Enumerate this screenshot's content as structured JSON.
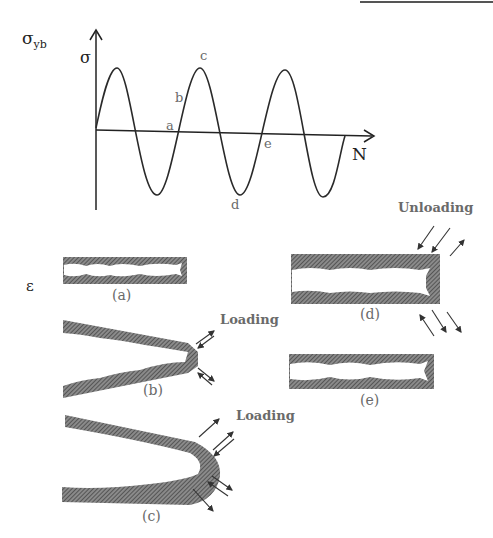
{
  "graph": {
    "y_label_outer": "σ",
    "y_label_outer_sub": "yb",
    "y_axis_label": "σ",
    "x_axis_label": "N",
    "points": {
      "a": "a",
      "b": "b",
      "c": "c",
      "d": "d",
      "e": "e"
    }
  },
  "strain_label": "ε",
  "panels": {
    "a": "(a)",
    "b": "(b)",
    "c": "(c)",
    "d": "(d)",
    "e": "(e)"
  },
  "annotations": {
    "loading_b": "Loading",
    "loading_c": "Loading",
    "unloading_d": "Unloading"
  },
  "colors": {
    "ink": "#333333",
    "hatch": "#6e6e6e",
    "label": "#6a6a6a"
  }
}
